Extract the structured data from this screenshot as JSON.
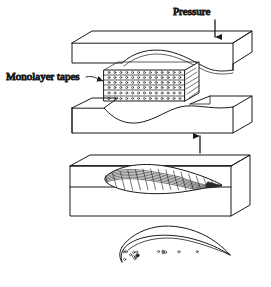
{
  "figure": {
    "type": "process-diagram",
    "ink_color": "#1a1a1a",
    "background_color": "#ffffff",
    "labels": {
      "pressure": "Pressure",
      "monolayer_tapes": "Monolayer tapes"
    },
    "stages": [
      {
        "name": "upper-die",
        "description": "Upper die block with wavy lower forming surface"
      },
      {
        "name": "tape-stack",
        "description": "Stack of monolayer tapes with fiber cross-sections",
        "layer_count": 6,
        "dots_per_layer": 13
      },
      {
        "name": "lower-die",
        "description": "Lower die block with wavy upper forming surface"
      },
      {
        "name": "consolidated-block",
        "description": "Die block containing consolidated curved part with cross-ply grid"
      },
      {
        "name": "finished-part",
        "description": "Finished curved airfoil part showing fiber cross-sections"
      }
    ],
    "arrows": [
      {
        "name": "pressure-arrow-down",
        "direction": "down"
      },
      {
        "name": "pressure-arrow-up",
        "direction": "up"
      }
    ]
  }
}
